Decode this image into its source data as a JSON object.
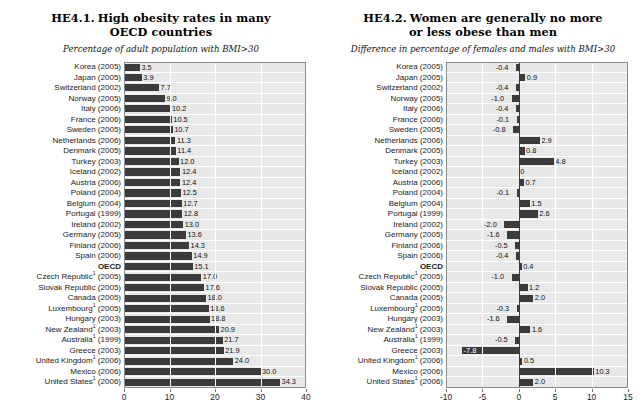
{
  "figure": {
    "background": "#ffffff",
    "bar_color": "#3b3b3b",
    "plot_background": "#e8e8e8",
    "gridline_color": "#ffffff"
  },
  "panels": [
    {
      "id": "he41",
      "title_number": "HE4.1.",
      "title_line1": "High obesity rates in many",
      "title_line2": "OECD countries",
      "subtitle": "Percentage of adult population with BMI>30"
    },
    {
      "id": "he42",
      "title_number": "HE4.2.",
      "title_line1": "Women are generally no more",
      "title_line2": "or less obese than men",
      "subtitle": "Difference in percentage of females and males with BMI>30"
    }
  ],
  "chart_data": [
    {
      "type": "bar",
      "orientation": "horizontal",
      "title": "HE4.1. High obesity rates in many OECD countries",
      "subtitle": "Percentage of adult population with BMI>30",
      "xlabel": "",
      "ylabel": "",
      "xlim": [
        0,
        40
      ],
      "xticks": [
        0,
        10,
        20,
        30,
        40
      ],
      "xtick_labels": [
        "0",
        "10",
        "20",
        "30",
        "40"
      ],
      "grid": true,
      "legend": "none",
      "categories": [
        "Korea (2005)",
        "Japan (2005)",
        "Switzerland (2002)",
        "Norway (2005)",
        "Italy (2006)",
        "France (2006)",
        "Sweden (2005)",
        "Netherlands (2006)",
        "Denmark (2005)",
        "Turkey (2003)",
        "Iceland (2002)",
        "Austria (2006)",
        "Poland (2004)",
        "Belgium (2004)",
        "Portugal (1999)",
        "Ireland (2002)",
        "Germany (2005)",
        "Finland (2006)",
        "Spain (2006)",
        "OECD",
        "Czech Republic¹ (2005)",
        "Slovak Republic (2005)",
        "Canada (2005)",
        "Luxembourg¹ (2005)",
        "Hungary (2003)",
        "New Zealand¹ (2003)",
        "Australia¹ (1999)",
        "Greece (2003)",
        "United Kingdom¹ (2006)",
        "Mexico (2006)",
        "United States¹ (2006)"
      ],
      "values": [
        3.5,
        3.9,
        7.7,
        9.0,
        10.2,
        10.5,
        10.7,
        11.3,
        11.4,
        12.0,
        12.4,
        12.4,
        12.5,
        12.7,
        12.8,
        13.0,
        13.6,
        14.3,
        14.9,
        15.1,
        17.0,
        17.6,
        18.0,
        18.6,
        18.8,
        20.9,
        21.7,
        21.9,
        24.0,
        30.0,
        34.3
      ],
      "value_labels": [
        "3.5",
        "3.9",
        "7.7",
        "9.0",
        "10.2",
        "10.5",
        "10.7",
        "11.3",
        "11.4",
        "12.0",
        "12.4",
        "12.4",
        "12.5",
        "12.7",
        "12.8",
        "13.0",
        "13.6",
        "14.3",
        "14.9",
        "15.1",
        "17.0",
        "17.6",
        "18.0",
        "18.6",
        "18.8",
        "20.9",
        "21.7",
        "21.9",
        "24.0",
        "30.0",
        "34.3"
      ]
    },
    {
      "type": "bar",
      "orientation": "horizontal",
      "title": "HE4.2. Women are generally no more or less obese than men",
      "subtitle": "Difference in percentage of females and males with BMI>30",
      "xlabel": "",
      "ylabel": "",
      "xlim": [
        -10,
        15
      ],
      "xticks": [
        -10,
        -5,
        0,
        5,
        10,
        15
      ],
      "xtick_labels": [
        "-10",
        "-5",
        "0",
        "5",
        "10",
        "15"
      ],
      "grid": true,
      "legend": "none",
      "categories": [
        "Korea (2005)",
        "Japan (2005)",
        "Switzerland (2002)",
        "Norway (2005)",
        "Italy (2006)",
        "France (2006)",
        "Sweden (2005)",
        "Netherlands (2006)",
        "Denmark (2005)",
        "Turkey (2003)",
        "Iceland (2002)",
        "Austria (2006)",
        "Poland (2004)",
        "Belgium (2004)",
        "Portugal (1999)",
        "Ireland (2002)",
        "Germany (2005)",
        "Finland (2006)",
        "Spain (2006)",
        "OECD",
        "Czech Republic¹ (2005)",
        "Slovak Republic (2005)",
        "Canada (2005)",
        "Luxembourg¹ (2005)",
        "Hungary (2003)",
        "New Zealand¹ (2003)",
        "Australia¹ (1999)",
        "Greece (2003)",
        "United Kingdom¹ (2006)",
        "Mexico (2006)",
        "United States¹ (2006)"
      ],
      "values": [
        -0.4,
        0.9,
        -0.4,
        -1.0,
        -0.4,
        -0.1,
        -0.8,
        2.9,
        0.8,
        4.8,
        0,
        0.7,
        -0.1,
        1.5,
        2.6,
        -2.0,
        -1.6,
        -0.5,
        -0.4,
        0.4,
        -1.0,
        1.2,
        2.0,
        -0.3,
        -1.6,
        1.6,
        -0.5,
        -7.8,
        0.5,
        10.3,
        2.0
      ],
      "value_labels": [
        "-0.4",
        "0.9",
        "-0.4",
        "-1.0",
        "-0.4",
        "-0.1",
        "-0.8",
        "2.9",
        "0.8",
        "4.8",
        "0",
        "0.7",
        "-0.1",
        "1.5",
        "2.6",
        "-2.0",
        "-1.6",
        "-0.5",
        "-0.4",
        "0.4",
        "-1.0",
        "1.2",
        "2.0",
        "-0.3",
        "-1.6",
        "1.6",
        "-0.5",
        "-7.8",
        "0.5",
        "10.3",
        "2.0"
      ]
    }
  ]
}
